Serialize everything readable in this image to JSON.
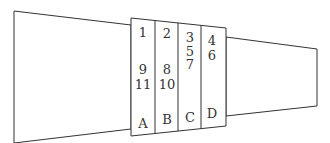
{
  "diagram": {
    "stroke_color": "#333333",
    "columns": [
      {
        "label": "A",
        "numbers": [
          "1",
          "9",
          "11"
        ]
      },
      {
        "label": "B",
        "numbers": [
          "2",
          "8",
          "10"
        ]
      },
      {
        "label": "C",
        "numbers": [
          "3",
          "5",
          "7"
        ]
      },
      {
        "label": "D",
        "numbers": [
          "4",
          "6"
        ]
      }
    ]
  }
}
